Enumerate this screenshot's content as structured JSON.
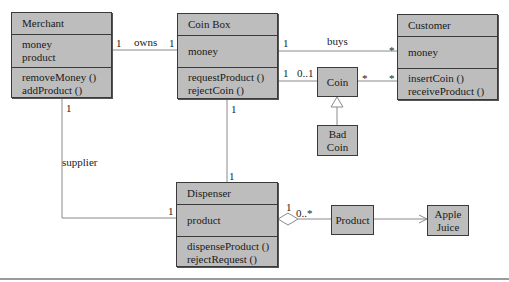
{
  "classes": {
    "merchant": {
      "name": "Merchant",
      "attributes": [
        "money",
        "product"
      ],
      "operations": [
        "removeMoney ()",
        "addProduct ()"
      ]
    },
    "coin_box": {
      "name": "Coin Box",
      "attributes": [
        "money"
      ],
      "operations": [
        "requestProduct ()",
        "rejectCoin ()"
      ]
    },
    "customer": {
      "name": "Customer",
      "attributes": [
        "money"
      ],
      "operations": [
        "insertCoin ()",
        "receiveProduct ()"
      ]
    },
    "dispenser": {
      "name": "Dispenser",
      "attributes": [
        "product"
      ],
      "operations": [
        "dispenseProduct ()",
        "rejectRequest ()"
      ]
    },
    "coin": {
      "name": "Coin"
    },
    "bad_coin": {
      "name_line1": "Bad",
      "name_line2": "Coin"
    },
    "product": {
      "name": "Product"
    },
    "apple_juice": {
      "name_line1": "Apple",
      "name_line2": "Juice"
    }
  },
  "associations": {
    "owns": {
      "label": "owns",
      "from_mult": "1",
      "to_mult": "1"
    },
    "buys": {
      "label": "buys",
      "from_mult": "1",
      "to_mult": "*"
    },
    "coinbox_coin": {
      "from_mult": "1",
      "to_mult": "0..1"
    },
    "coin_customer": {
      "from_mult": "*",
      "to_mult": "*"
    },
    "supplier": {
      "label": "supplier",
      "from_mult": "1",
      "to_mult": "1"
    },
    "coinbox_dispenser": {
      "from_mult": "1",
      "to_mult": "1"
    },
    "dispenser_product": {
      "from_mult": "1",
      "to_mult": "0..*"
    }
  },
  "colors": {
    "box_fill": "#bdbdbd",
    "line": "#8a8a8a",
    "border": "#3a3a3a"
  }
}
